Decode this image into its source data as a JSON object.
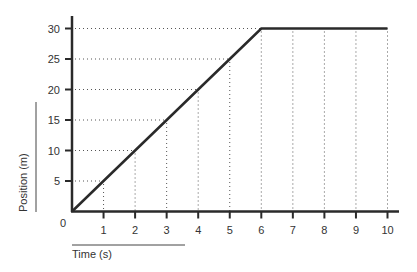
{
  "chart_data": {
    "type": "line",
    "title": "",
    "xlabel": "Time (s)",
    "ylabel": "Position (m)",
    "x": [
      0,
      1,
      2,
      3,
      4,
      5,
      6,
      7,
      8,
      9,
      10
    ],
    "series": [
      {
        "name": "Position",
        "values": [
          0,
          5,
          10,
          15,
          20,
          25,
          30,
          30,
          30,
          30,
          30
        ]
      }
    ],
    "xlim": [
      0,
      10
    ],
    "ylim": [
      0,
      30
    ],
    "x_ticks": [
      "1",
      "2",
      "3",
      "4",
      "5",
      "6",
      "7",
      "8",
      "9",
      "10"
    ],
    "y_ticks": [
      "5",
      "10",
      "15",
      "20",
      "25",
      "30"
    ],
    "origin_label": "0",
    "grid": "dotted guide lines from data points to axes",
    "legend": "none",
    "colors": {
      "line": "#2a2a2a",
      "axis": "#2a2a2a",
      "grid": "#555555",
      "text": "#333333"
    }
  }
}
